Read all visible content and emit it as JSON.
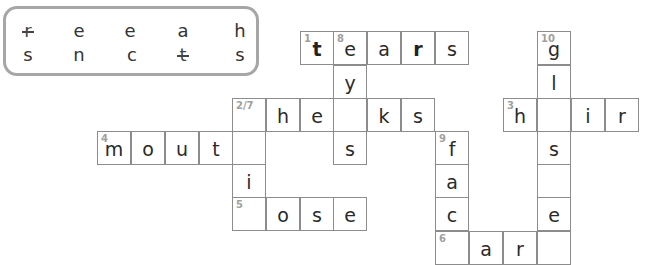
{
  "letter_bank": {
    "rows": [
      [
        {
          "char": "r",
          "struck": true
        },
        {
          "char": "e",
          "struck": false
        },
        {
          "char": "e",
          "struck": false
        },
        {
          "char": "a",
          "struck": false
        },
        {
          "char": "h",
          "struck": false
        }
      ],
      [
        {
          "char": "s",
          "struck": false
        },
        {
          "char": "n",
          "struck": false
        },
        {
          "char": "c",
          "struck": false
        },
        {
          "char": "t",
          "struck": true
        },
        {
          "char": "s",
          "struck": false
        }
      ]
    ]
  },
  "crossword": {
    "cell_size": 34,
    "cells": [
      {
        "x": 300,
        "y": 31,
        "num": "1",
        "char": "t",
        "bold": true
      },
      {
        "x": 333,
        "y": 31,
        "num": "8",
        "char": "e",
        "bold": false
      },
      {
        "x": 367,
        "y": 31,
        "num": "",
        "char": "a",
        "bold": false
      },
      {
        "x": 401,
        "y": 31,
        "num": "",
        "char": "r",
        "bold": true
      },
      {
        "x": 435,
        "y": 31,
        "num": "",
        "char": "s",
        "bold": false
      },
      {
        "x": 537,
        "y": 31,
        "num": "10",
        "char": "g",
        "bold": false
      },
      {
        "x": 333,
        "y": 65,
        "num": "",
        "char": "y",
        "bold": false
      },
      {
        "x": 537,
        "y": 65,
        "num": "",
        "char": "l",
        "bold": false
      },
      {
        "x": 232,
        "y": 98,
        "num": "2/7",
        "char": "",
        "bold": false
      },
      {
        "x": 266,
        "y": 98,
        "num": "",
        "char": "h",
        "bold": false
      },
      {
        "x": 300,
        "y": 98,
        "num": "",
        "char": "e",
        "bold": false
      },
      {
        "x": 333,
        "y": 98,
        "num": "",
        "char": "",
        "bold": false
      },
      {
        "x": 367,
        "y": 98,
        "num": "",
        "char": "k",
        "bold": false
      },
      {
        "x": 401,
        "y": 98,
        "num": "",
        "char": "s",
        "bold": false
      },
      {
        "x": 503,
        "y": 98,
        "num": "3",
        "char": "h",
        "bold": false
      },
      {
        "x": 537,
        "y": 98,
        "num": "",
        "char": "",
        "bold": false
      },
      {
        "x": 571,
        "y": 98,
        "num": "",
        "char": "i",
        "bold": false
      },
      {
        "x": 605,
        "y": 98,
        "num": "",
        "char": "r",
        "bold": false
      },
      {
        "x": 97,
        "y": 131,
        "num": "4",
        "char": "m",
        "bold": false
      },
      {
        "x": 131,
        "y": 131,
        "num": "",
        "char": "o",
        "bold": false
      },
      {
        "x": 165,
        "y": 131,
        "num": "",
        "char": "u",
        "bold": false
      },
      {
        "x": 199,
        "y": 131,
        "num": "",
        "char": "t",
        "bold": false
      },
      {
        "x": 232,
        "y": 131,
        "num": "",
        "char": "",
        "bold": false
      },
      {
        "x": 333,
        "y": 131,
        "num": "",
        "char": "s",
        "bold": false
      },
      {
        "x": 435,
        "y": 131,
        "num": "9",
        "char": "f",
        "bold": false
      },
      {
        "x": 537,
        "y": 131,
        "num": "",
        "char": "s",
        "bold": false
      },
      {
        "x": 232,
        "y": 164,
        "num": "",
        "char": "i",
        "bold": false
      },
      {
        "x": 435,
        "y": 164,
        "num": "",
        "char": "a",
        "bold": false
      },
      {
        "x": 537,
        "y": 164,
        "num": "",
        "char": "",
        "bold": false
      },
      {
        "x": 232,
        "y": 197,
        "num": "5",
        "char": "",
        "bold": false
      },
      {
        "x": 266,
        "y": 197,
        "num": "",
        "char": "o",
        "bold": false
      },
      {
        "x": 300,
        "y": 197,
        "num": "",
        "char": "s",
        "bold": false
      },
      {
        "x": 333,
        "y": 197,
        "num": "",
        "char": "e",
        "bold": false
      },
      {
        "x": 435,
        "y": 197,
        "num": "",
        "char": "c",
        "bold": false
      },
      {
        "x": 537,
        "y": 197,
        "num": "",
        "char": "e",
        "bold": false
      },
      {
        "x": 435,
        "y": 231,
        "num": "6",
        "char": "",
        "bold": false
      },
      {
        "x": 469,
        "y": 231,
        "num": "",
        "char": "a",
        "bold": false
      },
      {
        "x": 503,
        "y": 231,
        "num": "",
        "char": "r",
        "bold": false
      },
      {
        "x": 537,
        "y": 231,
        "num": "",
        "char": "",
        "bold": false
      }
    ]
  },
  "colors": {
    "box_border": "#a6a6a6",
    "cell_border": "#8c8c8c",
    "clue_number": "#a0a0a0",
    "letter": "#2a2a2a"
  }
}
